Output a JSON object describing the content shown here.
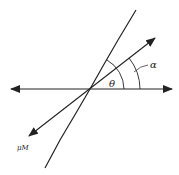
{
  "diagram": {
    "labels": {
      "theta": "θ",
      "alpha": "α",
      "moment": "μM"
    },
    "colors": {
      "stroke": "#222222",
      "background": "#ffffff"
    },
    "geometry": {
      "origin": [
        90,
        89
      ],
      "horizontal_axis": {
        "x1": 10,
        "x2": 173,
        "y": 89,
        "arrows": "both"
      },
      "inclined_line": {
        "x1": 136,
        "y1": 10,
        "x2": 45,
        "y2": 168
      },
      "vector": {
        "x1": 28,
        "y1": 137,
        "x2": 155,
        "y2": 38,
        "arrows": "both"
      },
      "arc_theta_radius": 34,
      "arc_alpha_radius": 50
    }
  }
}
